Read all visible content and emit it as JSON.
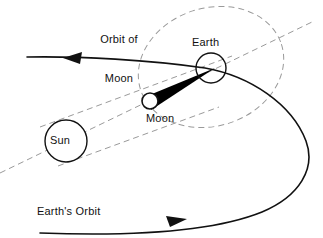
{
  "figure": {
    "background_color": "#ffffff",
    "stroke_color": "#111111",
    "dashed_color": "#9a9a9a",
    "umbra_color": "#000000",
    "width": 323,
    "height": 238
  },
  "labels": {
    "orbit_of_moon": "Orbit of\nMoon",
    "orbit_of_moon_line1": "Orbit of",
    "orbit_of_moon_line2": "Moon",
    "earth": "Earth",
    "moon": "Moon",
    "sun": "Sun",
    "earths_orbit": "Earth's Orbit"
  },
  "bodies": {
    "sun": {
      "name": "Sun",
      "cx": 66,
      "cy": 141,
      "r": 21,
      "fill": "#ffffff",
      "stroke": "#111111"
    },
    "earth": {
      "name": "Earth",
      "cx": 211,
      "cy": 68,
      "r": 15,
      "fill": "#ffffff",
      "stroke": "#111111"
    },
    "moon": {
      "name": "Moon",
      "cx": 150,
      "cy": 101,
      "r": 8,
      "fill": "#ffffff",
      "stroke": "#111111"
    }
  },
  "orbits": {
    "moon_orbit": {
      "name": "Orbit of Moon",
      "style": "dashed",
      "shape": "tilted-ellipse",
      "cx": 211,
      "cy": 67,
      "rx": 74,
      "ry": 59,
      "rotation_deg": -18
    },
    "earth_orbit": {
      "name": "Earth's Orbit",
      "style": "solid",
      "shape": "open-curve-with-right-loop",
      "direction_upper": "leftward",
      "direction_lower": "rightward"
    }
  },
  "rays": {
    "center_axis": {
      "name": "Sun-Moon-Earth axis",
      "style": "dashed",
      "from": [
        0,
        173
      ],
      "to": [
        312,
        22
      ]
    },
    "tangent_upper": {
      "name": "upper tangent ray",
      "style": "dashed",
      "from": [
        46,
        124
      ],
      "to": [
        226,
        58
      ]
    },
    "tangent_lower": {
      "name": "lower tangent ray",
      "style": "dashed",
      "from": [
        66,
        162
      ],
      "to": [
        213,
        108
      ]
    }
  },
  "shadow": {
    "umbra": {
      "name": "umbral shadow cone",
      "fill": "#000000",
      "apex": [
        214,
        68
      ],
      "base_from": [
        151,
        93
      ],
      "base_to": [
        149,
        110
      ]
    }
  },
  "arrows": {
    "upper": {
      "name": "upper direction arrow",
      "x": 73,
      "y": 59,
      "points": "left"
    },
    "lower": {
      "name": "lower direction arrow",
      "x": 176,
      "y": 221,
      "points": "right"
    }
  }
}
